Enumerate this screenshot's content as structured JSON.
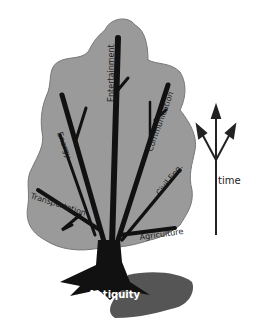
{
  "diagram": {
    "type": "technology-tree",
    "root": "Antiquity",
    "branches": [
      "Entertainment",
      "Communication",
      "Energy",
      "Civil Eng.",
      "Transportation",
      "Agriculture"
    ],
    "axis_label": "time"
  },
  "colors": {
    "foliage": "#9a9a9a",
    "trunk": "#111111",
    "shadow": "#555555",
    "arrow": "#222222"
  }
}
